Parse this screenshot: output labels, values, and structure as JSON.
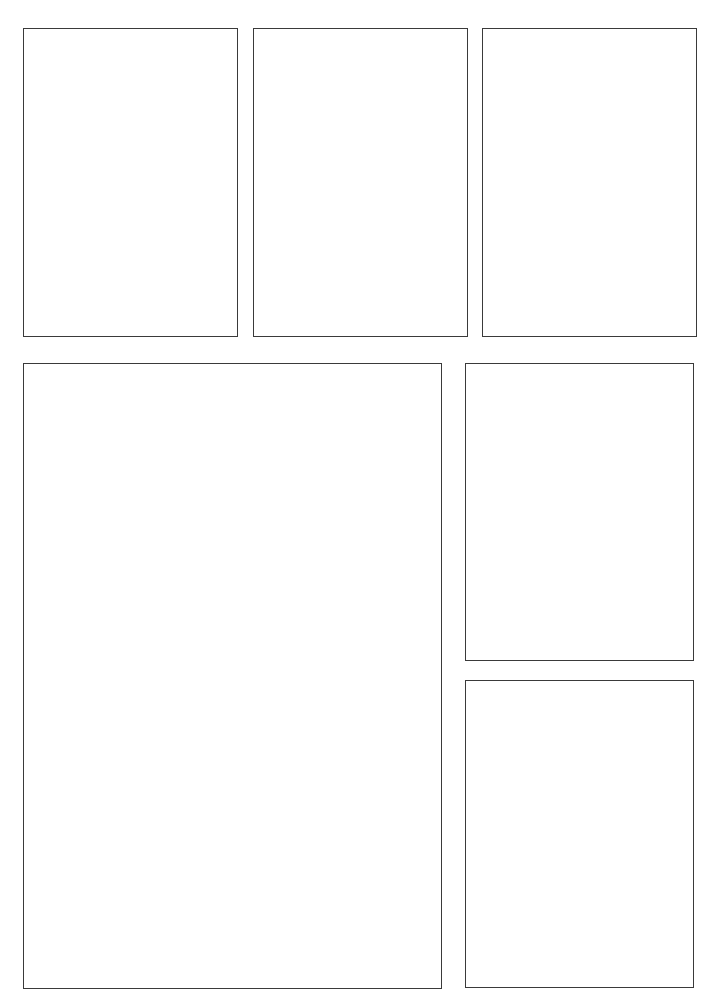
{
  "page": {
    "background": "#ffffff",
    "border_color": "#3a3a3a",
    "panel_count": 6
  },
  "panels": [
    {
      "id": "panel-1",
      "row": 1,
      "x": 23,
      "y": 28,
      "w": 215,
      "h": 309,
      "content": ""
    },
    {
      "id": "panel-2",
      "row": 1,
      "x": 253,
      "y": 28,
      "w": 215,
      "h": 309,
      "content": ""
    },
    {
      "id": "panel-3",
      "row": 1,
      "x": 482,
      "y": 28,
      "w": 215,
      "h": 309,
      "content": ""
    },
    {
      "id": "panel-4",
      "row": 2,
      "x": 23,
      "y": 363,
      "w": 419,
      "h": 626,
      "content": ""
    },
    {
      "id": "panel-5",
      "row": 2,
      "x": 465,
      "y": 363,
      "w": 229,
      "h": 298,
      "content": ""
    },
    {
      "id": "panel-6",
      "row": 2,
      "x": 465,
      "y": 680,
      "w": 229,
      "h": 308,
      "content": ""
    }
  ]
}
